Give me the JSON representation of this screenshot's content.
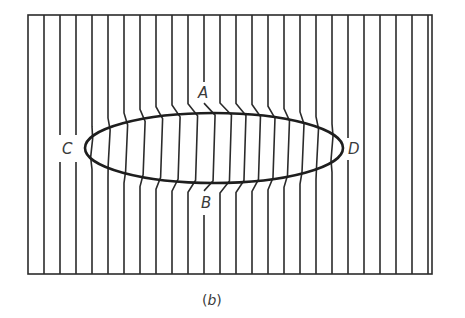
{
  "figure": {
    "caption_open": "(",
    "caption_letter": "b",
    "caption_close": ")",
    "labels": {
      "A": "A",
      "B": "B",
      "C": "C",
      "D": "D"
    },
    "colors": {
      "line": "#2b2b2b",
      "ellipse": "#1e1e1e",
      "background": "#ffffff"
    },
    "frame": {
      "left": 28,
      "top": 15,
      "right": 432,
      "bottom": 274
    },
    "ellipse": {
      "cx": 214,
      "cy": 148,
      "rx": 129,
      "ry": 35
    },
    "field_line_spacing": 16
  }
}
